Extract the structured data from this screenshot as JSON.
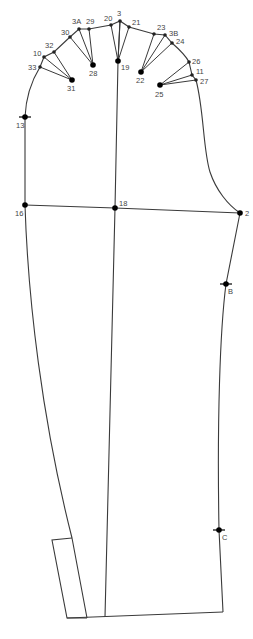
{
  "diagram": {
    "stroke_color": "#3a3a3a",
    "background": "#ffffff",
    "points": [
      {
        "id": "3",
        "label": "3",
        "x": 120,
        "y": 21,
        "size": "small",
        "lx": 117,
        "ly": 16
      },
      {
        "id": "20",
        "label": "20",
        "x": 111,
        "y": 25,
        "size": "small",
        "lx": 104,
        "ly": 21
      },
      {
        "id": "21",
        "label": "21",
        "x": 129,
        "y": 27,
        "size": "small",
        "lx": 132,
        "ly": 25
      },
      {
        "id": "29",
        "label": "29",
        "x": 89,
        "y": 29,
        "size": "small",
        "lx": 86,
        "ly": 24
      },
      {
        "id": "3A",
        "label": "3A",
        "x": 79,
        "y": 29,
        "size": "small",
        "lx": 72,
        "ly": 24
      },
      {
        "id": "30",
        "label": "30",
        "x": 70,
        "y": 37,
        "size": "small",
        "lx": 61,
        "ly": 35
      },
      {
        "id": "32",
        "label": "32",
        "x": 54,
        "y": 52,
        "size": "small",
        "lx": 45,
        "ly": 48
      },
      {
        "id": "10",
        "label": "10",
        "x": 44,
        "y": 57,
        "size": "small",
        "lx": 33,
        "ly": 56
      },
      {
        "id": "33",
        "label": "33",
        "x": 40,
        "y": 67,
        "size": "small",
        "lx": 28,
        "ly": 70
      },
      {
        "id": "31",
        "label": "31",
        "x": 72,
        "y": 80,
        "size": "big",
        "lx": 67,
        "ly": 91
      },
      {
        "id": "28",
        "label": "28",
        "x": 93,
        "y": 65,
        "size": "big",
        "lx": 89,
        "ly": 76
      },
      {
        "id": "19",
        "label": "19",
        "x": 118,
        "y": 61,
        "size": "big",
        "lx": 121,
        "ly": 70
      },
      {
        "id": "23",
        "label": "23",
        "x": 154,
        "y": 34,
        "size": "small",
        "lx": 157,
        "ly": 30
      },
      {
        "id": "3B",
        "label": "3B",
        "x": 165,
        "y": 35,
        "size": "small",
        "lx": 169,
        "ly": 36
      },
      {
        "id": "24",
        "label": "24",
        "x": 172,
        "y": 43,
        "size": "small",
        "lx": 176,
        "ly": 44
      },
      {
        "id": "22",
        "label": "22",
        "x": 141,
        "y": 72,
        "size": "big",
        "lx": 136,
        "ly": 83
      },
      {
        "id": "26",
        "label": "26",
        "x": 189,
        "y": 62,
        "size": "small",
        "lx": 192,
        "ly": 64
      },
      {
        "id": "11",
        "label": "11",
        "x": 192,
        "y": 75,
        "size": "small",
        "lx": 196,
        "ly": 74
      },
      {
        "id": "27",
        "label": "27",
        "x": 196,
        "y": 80,
        "size": "small",
        "lx": 200,
        "ly": 84
      },
      {
        "id": "25",
        "label": "25",
        "x": 160,
        "y": 85,
        "size": "big",
        "lx": 155,
        "ly": 97
      },
      {
        "id": "13",
        "label": "13",
        "x": 25,
        "y": 117,
        "size": "notch",
        "lx": 16,
        "ly": 128
      },
      {
        "id": "16",
        "label": "16",
        "x": 25,
        "y": 205,
        "size": "big",
        "lx": 15,
        "ly": 216
      },
      {
        "id": "18",
        "label": "18",
        "x": 115,
        "y": 208,
        "size": "big",
        "lx": 119,
        "ly": 206
      },
      {
        "id": "2",
        "label": "2",
        "x": 240,
        "y": 213,
        "size": "big",
        "lx": 245,
        "ly": 216
      },
      {
        "id": "B",
        "label": "B",
        "x": 226,
        "y": 284,
        "size": "notch",
        "lx": 228,
        "ly": 294
      },
      {
        "id": "C",
        "label": "C",
        "x": 219,
        "y": 530,
        "size": "notch",
        "lx": 222,
        "ly": 540
      }
    ],
    "dart_groups": [
      {
        "apex": "31",
        "to": [
          "10",
          "33",
          "32"
        ]
      },
      {
        "apex": "28",
        "to": [
          "3A",
          "30",
          "29"
        ]
      },
      {
        "apex": "19",
        "to": [
          "20",
          "3",
          "21"
        ]
      },
      {
        "apex": "22",
        "to": [
          "23",
          "3B",
          "24"
        ]
      },
      {
        "apex": "25",
        "to": [
          "26",
          "11",
          "27"
        ]
      }
    ]
  }
}
